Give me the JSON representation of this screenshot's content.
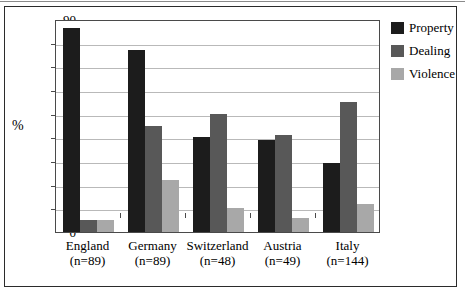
{
  "chart_data": {
    "type": "bar",
    "title": "",
    "subtitle": "",
    "xlabel": "",
    "ylabel": "%",
    "ylim": [
      0,
      90
    ],
    "ytick_step": 10,
    "yticks": [
      90,
      80,
      70,
      60,
      50,
      40,
      30,
      20,
      10,
      0
    ],
    "grid": true,
    "legend_position": "right",
    "categories": [
      "England",
      "Germany",
      "Switzerland",
      "Austria",
      "Italy"
    ],
    "category_sublabels": [
      "(n=89)",
      "(n=89)",
      "(n=48)",
      "(n=49)",
      "(n=144)"
    ],
    "series": [
      {
        "name": "Property",
        "color": "#1c1c1c",
        "values": [
          86,
          77,
          40,
          39,
          29
        ]
      },
      {
        "name": "Dealing",
        "color": "#585858",
        "values": [
          5,
          45,
          50,
          41,
          55
        ]
      },
      {
        "name": "Violence",
        "color": "#a8a8a8",
        "values": [
          5,
          22,
          10,
          6,
          12
        ]
      }
    ]
  },
  "legend": {
    "items": [
      {
        "label": "Property",
        "color": "#1c1c1c"
      },
      {
        "label": "Dealing",
        "color": "#585858"
      },
      {
        "label": "Violence",
        "color": "#a8a8a8"
      }
    ]
  },
  "axis": {
    "y_title": "%"
  }
}
